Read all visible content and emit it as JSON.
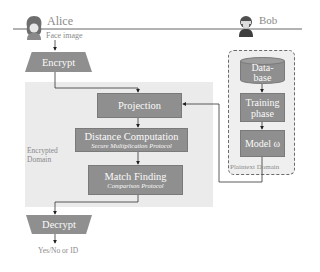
{
  "parties": {
    "alice": {
      "name": "Alice",
      "input_label": "Face image"
    },
    "bob": {
      "name": "Bob"
    }
  },
  "alice_side": {
    "encrypt_label": "Encrypt",
    "decrypt_label": "Decrypt",
    "output_label": "Yes/No or ID"
  },
  "encrypted_domain": {
    "label_line1": "Encrypted",
    "label_line2": "Domain",
    "steps": [
      {
        "title": "Projection",
        "subtitle": ""
      },
      {
        "title": "Distance Computation",
        "subtitle": "Secure Multiplication Protocol"
      },
      {
        "title": "Match Finding",
        "subtitle": "Comparison Protocol"
      }
    ]
  },
  "plaintext_domain": {
    "label": "Plaintext Domain",
    "database_line1": "Data-",
    "database_line2": "base",
    "training_line1": "Training",
    "training_line2": "phase",
    "model_label": "Model ω"
  },
  "colors": {
    "box_fill": "#8f8f8f",
    "box_text": "#fafafa",
    "encrypted_panel": "#ebebeb",
    "plaintext_panel": "#efefef",
    "line": "#555555"
  }
}
